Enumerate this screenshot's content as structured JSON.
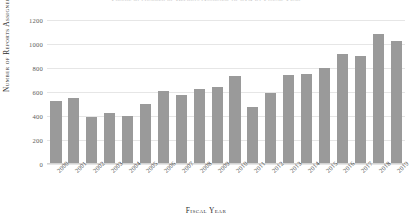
{
  "chart_data": {
    "type": "bar",
    "title": "Figure 3: Number of Reports Assigned to OIG by Fiscal Year",
    "xlabel": "Fiscal Year",
    "ylabel": "Number of Reports Assigned",
    "categories": [
      "2000",
      "2001",
      "2002",
      "2003",
      "2004",
      "2005",
      "2006",
      "2007",
      "2008",
      "2009",
      "2010",
      "2011",
      "2012",
      "2013",
      "2014",
      "2015",
      "2016",
      "2017",
      "2018",
      "2019"
    ],
    "values": [
      520,
      545,
      385,
      415,
      395,
      495,
      600,
      565,
      620,
      635,
      725,
      465,
      580,
      730,
      745,
      795,
      905,
      890,
      1075,
      1020
    ],
    "ylim": [
      0,
      1200
    ],
    "yticks": [
      0,
      200,
      400,
      600,
      800,
      1000,
      1200
    ],
    "ytick_labels": [
      "0",
      "200",
      "400",
      "600",
      "800",
      "1000",
      "1200"
    ],
    "grid": true,
    "legend": "none",
    "bar_color": "#9a9a9a",
    "grid_color": "#e6e6e6"
  }
}
